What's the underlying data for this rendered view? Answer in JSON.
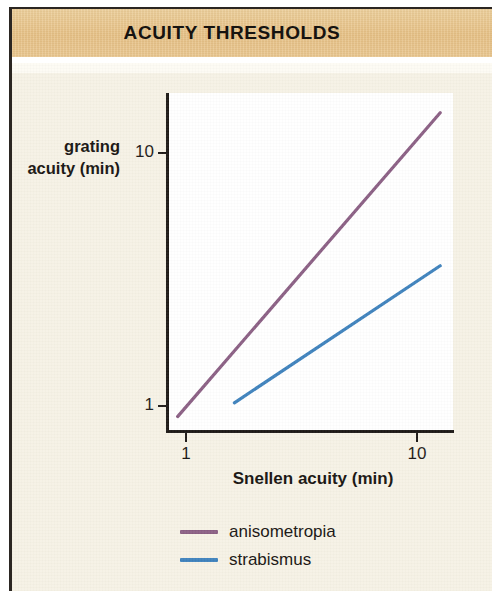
{
  "title": "ACUITY THRESHOLDS",
  "theme": {
    "title_band_color": "#E9C68E",
    "page_background": "#F6F2E5",
    "plot_background": "#FFFFFF",
    "axis_color": "#1C1815",
    "text_color": "#161310"
  },
  "axes": {
    "y_label_line1": "grating",
    "y_label_line2": "acuity (min)",
    "x_label": "Snellen acuity (min)",
    "y_ticks": [
      "1",
      "10"
    ],
    "x_ticks": [
      "1",
      "10"
    ]
  },
  "legend": {
    "items": [
      {
        "label": "anisometropia",
        "color": "#8A5E83"
      },
      {
        "label": "strabismus",
        "color": "#3D81BC"
      }
    ]
  },
  "chart_data": {
    "type": "line",
    "title": "ACUITY THRESHOLDS",
    "subtitle": "",
    "xlabel": "Snellen acuity (min)",
    "ylabel": "grating acuity (min)",
    "xscale": "log",
    "yscale": "log",
    "xlim": [
      0.9,
      13.0
    ],
    "ylim": [
      0.85,
      15.5
    ],
    "xticks": [
      1,
      10
    ],
    "yticks": [
      1,
      10
    ],
    "grid": false,
    "legend_position": "below-plot-left",
    "series": [
      {
        "name": "anisometropia",
        "color": "#8A5E83",
        "x": [
          0.92,
          12.6
        ],
        "y": [
          0.9,
          14.3
        ],
        "description": "straight line on log-log axes spanning nearly the full plot, slope slightly greater than 1"
      },
      {
        "name": "strabismus",
        "color": "#3D81BC",
        "x": [
          1.62,
          12.6
        ],
        "y": [
          1.02,
          3.55
        ],
        "description": "straight line on log-log axes beginning mid-low left and ending at right, shallower slope, lying below the anisometropia line"
      }
    ]
  }
}
